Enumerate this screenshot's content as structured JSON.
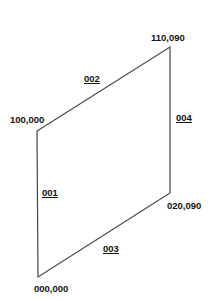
{
  "diagram": {
    "vertices": [
      {
        "id": "bottom-left",
        "label": "000,000",
        "x": 38,
        "y": 277
      },
      {
        "id": "top-left",
        "label": "100,000",
        "x": 37,
        "y": 131
      },
      {
        "id": "top-right",
        "label": "110,090",
        "x": 170,
        "y": 47
      },
      {
        "id": "bottom-right",
        "label": "020,090",
        "x": 170,
        "y": 193
      }
    ],
    "edges": [
      {
        "label": "001",
        "from": "bottom-left",
        "to": "top-left"
      },
      {
        "label": "002",
        "from": "top-left",
        "to": "top-right"
      },
      {
        "label": "003",
        "from": "bottom-left",
        "to": "bottom-right"
      },
      {
        "label": "004",
        "from": "bottom-right",
        "to": "top-right"
      }
    ],
    "line_color": "#444444",
    "text_color": "#111111"
  }
}
